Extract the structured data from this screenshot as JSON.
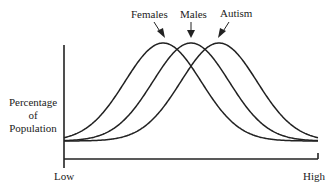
{
  "chart_data": {
    "type": "line",
    "title": "",
    "xlabel": "",
    "ylabel": "Percentage of Population",
    "ylabel_lines": [
      "Percentage",
      "of",
      "Population"
    ],
    "x_tick_labels": {
      "low": "Low",
      "high": "High"
    },
    "legend_position": "annotations above peaks with arrows",
    "grid": false,
    "series": [
      {
        "name": "Females",
        "shape": "bell curve",
        "peak_position": 0.39,
        "peak_height": 1.0
      },
      {
        "name": "Males",
        "shape": "bell curve",
        "peak_position": 0.5,
        "peak_height": 1.0
      },
      {
        "name": "Autism",
        "shape": "bell curve",
        "peak_position": 0.61,
        "peak_height": 1.0
      }
    ],
    "annotations": [
      "Females",
      "Males",
      "Autism"
    ]
  },
  "labels": {
    "females": "Females",
    "males": "Males",
    "autism": "Autism",
    "low": "Low",
    "high": "High",
    "ylabel_1": "Percentage",
    "ylabel_2": "of",
    "ylabel_3": "Population"
  },
  "colors": {
    "line": "#222222",
    "background": "#ffffff"
  }
}
